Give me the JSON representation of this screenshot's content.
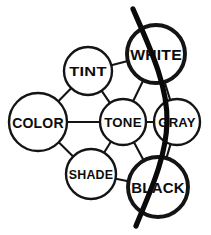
{
  "diagram": {
    "type": "node-link-graph",
    "canvas": {
      "width": 211,
      "height": 235
    },
    "colors": {
      "ink": "#141414",
      "background": "#ffffff",
      "divider": "#0a0a0a"
    },
    "nodes": [
      {
        "id": "color",
        "label": "COLOR",
        "cx": 38,
        "cy": 122,
        "r": 29,
        "font_size": 15,
        "emphasis": "normal"
      },
      {
        "id": "tint",
        "label": "TINT",
        "cx": 88,
        "cy": 71,
        "r": 24,
        "font_size": 12,
        "emphasis": "normal"
      },
      {
        "id": "white",
        "label": "WHITE",
        "cx": 156,
        "cy": 54,
        "r": 29,
        "font_size": 15,
        "emphasis": "heavy"
      },
      {
        "id": "tone",
        "label": "TONE",
        "cx": 123,
        "cy": 122,
        "r": 23,
        "font_size": 12,
        "emphasis": "normal"
      },
      {
        "id": "gray",
        "label": "GRAY",
        "cx": 177,
        "cy": 122,
        "r": 23,
        "font_size": 12,
        "emphasis": "normal"
      },
      {
        "id": "shade",
        "label": "SHADE",
        "cx": 91,
        "cy": 174,
        "r": 25,
        "font_size": 12,
        "emphasis": "normal"
      },
      {
        "id": "black",
        "label": "BLACK",
        "cx": 158,
        "cy": 187,
        "r": 30,
        "font_size": 15,
        "emphasis": "heavy"
      }
    ],
    "edges": [
      {
        "from": "color",
        "to": "tint"
      },
      {
        "from": "color",
        "to": "tone"
      },
      {
        "from": "color",
        "to": "shade"
      },
      {
        "from": "tint",
        "to": "white"
      },
      {
        "from": "tint",
        "to": "tone"
      },
      {
        "from": "white",
        "to": "tone"
      },
      {
        "from": "white",
        "to": "gray"
      },
      {
        "from": "tone",
        "to": "gray"
      },
      {
        "from": "tone",
        "to": "shade"
      },
      {
        "from": "tone",
        "to": "black"
      },
      {
        "from": "shade",
        "to": "black"
      },
      {
        "from": "gray",
        "to": "black"
      }
    ],
    "divider": {
      "name": "achromatic-divider-curve",
      "path": "M 133 9 C 150 48, 168 86, 167 122 C 166 160, 148 196, 136 226"
    }
  }
}
